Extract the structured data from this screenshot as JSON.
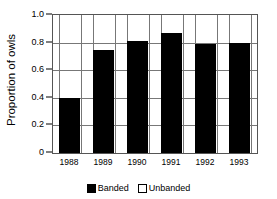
{
  "chart_data": {
    "type": "bar",
    "title": "",
    "subtitle": "",
    "xlabel": "",
    "ylabel": "Proportion of owls",
    "categories": [
      "1988",
      "1989",
      "1990",
      "1991",
      "1992",
      "1993"
    ],
    "series": [
      {
        "name": "Banded",
        "color": "#000000",
        "values": [
          0.4,
          0.75,
          0.81,
          0.87,
          0.79,
          0.8
        ]
      },
      {
        "name": "Unbanded",
        "color": "#ffffff",
        "values": [
          0.6,
          0.25,
          0.19,
          0.13,
          0.21,
          0.2
        ]
      }
    ],
    "stacked": true,
    "ylim": [
      0,
      1.0
    ],
    "ytick_values": [
      0,
      0.2,
      0.4,
      0.6,
      0.8,
      1.0
    ],
    "ytick_labels": [
      "0",
      "0.2",
      "0.4",
      "0.6",
      "0.8",
      "1.0"
    ],
    "grid": "horizontal-and-vertical",
    "legend_position": "bottom-center",
    "legend": [
      {
        "label": "Banded",
        "swatch": "filled-black-square"
      },
      {
        "label": "Unbanded",
        "swatch": "open-white-square"
      }
    ]
  },
  "axes": {
    "y_title": "Proportion of owls"
  }
}
